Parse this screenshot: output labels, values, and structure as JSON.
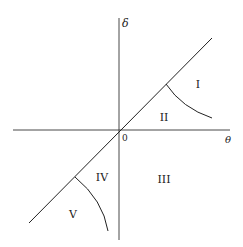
{
  "diagram": {
    "axes": {
      "x_label": "θ",
      "y_label": "δ",
      "origin_label": "0"
    },
    "regions": [
      {
        "id": "I",
        "label": "I"
      },
      {
        "id": "II",
        "label": "II"
      },
      {
        "id": "III",
        "label": "III"
      },
      {
        "id": "IV",
        "label": "IV"
      },
      {
        "id": "V",
        "label": "V"
      }
    ],
    "colors": {
      "line": "#222222",
      "background": "#ffffff"
    }
  }
}
